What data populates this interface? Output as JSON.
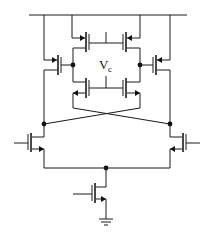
{
  "diagram": {
    "type": "circuit-schematic",
    "labels": {
      "control_voltage_main": "V",
      "control_voltage_sub": "c"
    },
    "components": [
      {
        "id": "M_pmos_outer_left",
        "kind": "PMOS"
      },
      {
        "id": "M_pmos_inner_left",
        "kind": "PMOS"
      },
      {
        "id": "M_pmos_inner_right",
        "kind": "PMOS"
      },
      {
        "id": "M_pmos_outer_right",
        "kind": "PMOS"
      },
      {
        "id": "M_nmos_ctrl_left",
        "kind": "NMOS"
      },
      {
        "id": "M_nmos_ctrl_right",
        "kind": "NMOS"
      },
      {
        "id": "M_nmos_input_left",
        "kind": "NMOS"
      },
      {
        "id": "M_nmos_input_right",
        "kind": "NMOS"
      },
      {
        "id": "M_nmos_tail",
        "kind": "NMOS"
      }
    ],
    "nodes": [
      "supply-rail",
      "out-left",
      "out-right",
      "tail-node",
      "ground"
    ]
  }
}
